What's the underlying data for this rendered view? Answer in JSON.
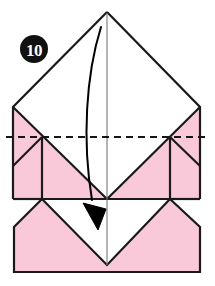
{
  "diagram": {
    "step_label": "10",
    "step_badge_name": "step-number-badge",
    "colors": {
      "paper_front": "#f9c9da",
      "paper_back": "#ffffff",
      "line": "#1a1a1a",
      "thin_line": "#6b6b6b",
      "badge_fill": "#111111",
      "badge_text": "#ffffff",
      "arrow": "#000000",
      "background": "#ffffff"
    },
    "instruction_arrow": {
      "name": "fold-direction-arrow",
      "type": "curved-valley-fold-arrow",
      "from_x": 101,
      "from_y": 27,
      "to_x": 98,
      "to_y": 228,
      "direction": "down"
    },
    "crease_line": {
      "name": "valley-fold-crease",
      "style": "dashed",
      "y": 137,
      "x_start": 6,
      "x_end": 209
    },
    "center_line": {
      "name": "vertical-center-line",
      "style": "thin-solid",
      "x": 107,
      "y_start": 13,
      "y_end": 265
    },
    "geometry": {
      "apex_x": 107,
      "apex_y": 12,
      "left_x": 13,
      "right_x": 200,
      "shoulder_y": 107,
      "crease_y": 137,
      "mid_y": 199,
      "inner_left_x": 42,
      "inner_right_x": 170,
      "lower_corner_y": 250,
      "bottom_y": 272,
      "v_point_y": 265
    }
  }
}
